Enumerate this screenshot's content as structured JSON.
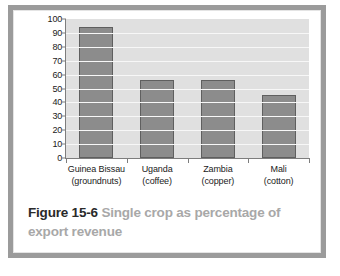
{
  "figure": {
    "caption_number": "Figure 15-6",
    "caption_title": "Single crop as percentage of export revenue",
    "frame_color": "#9b9b9b",
    "panel_color": "#ffffff"
  },
  "chart_data": {
    "type": "bar",
    "title": "Single crop as percentage of export revenue",
    "xlabel": "",
    "ylabel": "",
    "ylim": [
      0,
      100
    ],
    "ytick_step": 10,
    "yticks": [
      "100",
      "90",
      "80",
      "70",
      "60",
      "50",
      "40",
      "30",
      "20",
      "10",
      "0"
    ],
    "grid": true,
    "legend": false,
    "bar_color": "#8c8c8c",
    "bar_edge_color": "#5f5f5f",
    "plot_background": "#e0e0e0",
    "gridline_color": "#f7f7f7",
    "categories": [
      "Guinea Bissau (groundnuts)",
      "Uganda (coffee)",
      "Zambia (copper)",
      "Mali (cotton)"
    ],
    "category_lines": [
      {
        "line1": "Guinea Bissau",
        "line2": "(groundnuts)"
      },
      {
        "line1": "Uganda",
        "line2": "(coffee)"
      },
      {
        "line1": "Zambia",
        "line2": "(copper)"
      },
      {
        "line1": "Mali",
        "line2": "(cotton)"
      }
    ],
    "values": [
      94,
      56,
      56,
      45
    ]
  }
}
